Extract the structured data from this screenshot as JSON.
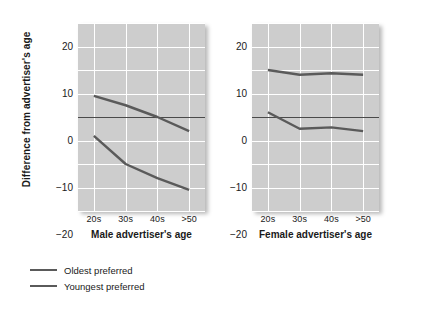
{
  "chart_data": {
    "type": "line",
    "title": "",
    "ylabel": "Difference from advertiser's age",
    "ylim": [
      -20,
      20
    ],
    "yticks": [
      20,
      10,
      0,
      -10,
      -20
    ],
    "ytick_labels": [
      "20",
      "10",
      "0",
      "−10",
      "−20"
    ],
    "grid": true,
    "grid_step": 5,
    "legend_position": "below-left",
    "categories": [
      "20s",
      "30s",
      "40s",
      ">50"
    ],
    "panels": [
      {
        "name": "male",
        "xlabel": "Male advertiser's age",
        "categories": [
          "20s",
          "30s",
          "40s",
          ">50"
        ],
        "series": [
          {
            "name": "Oldest preferred",
            "values": [
              4.5,
              2.5,
              0,
              -3
            ]
          },
          {
            "name": "Youngest preferred",
            "values": [
              -4,
              -10,
              -13,
              -15.5
            ]
          }
        ]
      },
      {
        "name": "female",
        "xlabel": "Female advertiser's age",
        "categories": [
          "20s",
          "30s",
          "40s",
          ">50"
        ],
        "series": [
          {
            "name": "Oldest preferred",
            "values": [
              10,
              9,
              9.3,
              9
            ]
          },
          {
            "name": "Youngest preferred",
            "values": [
              1,
              -2.5,
              -2.2,
              -3
            ]
          }
        ]
      }
    ],
    "legend": [
      {
        "label": "Oldest preferred",
        "color": "#5a5a5a"
      },
      {
        "label": "Youngest preferred",
        "color": "#5a5a5a"
      }
    ],
    "colors": {
      "plot_background": "#cdcdcd",
      "gridline": "#ffffff",
      "series_line": "#5a5a5a",
      "zero_line": "#4a4a4a",
      "page_background": "#ffffff",
      "text": "#1a1a1a"
    }
  }
}
